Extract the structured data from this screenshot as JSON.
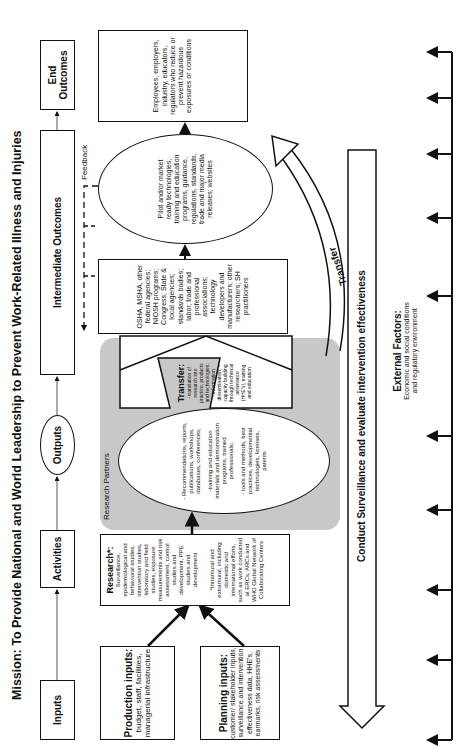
{
  "title": "Mission: To Provide National and World Leadership to Prevent Work-Related Illness and Injuries",
  "header_row": {
    "inputs": "Inputs",
    "activities": "Activities",
    "outputs": "Outputs",
    "intermediate": "Intermediate Outcomes",
    "end": "End Outcomes"
  },
  "inputs": {
    "production": {
      "heading": "Production inputs:",
      "text": "budget, staff, facilities, managerial infrastructure"
    },
    "planning": {
      "heading": "Planning inputs:",
      "text": "customer/ stakeholder inputs, surveillance and intervention effectiveness data, HHE's, earmarks, risk assessments"
    }
  },
  "research": {
    "heading": "Research*:",
    "text": "Surveillance, epidemiological and behavioral studies, intervention studies, laboratory and field studies, exposure measurements and risk assessment, control studies and development, PPE studies and development",
    "footnote": "*Intramural and extramural, including domestic and international efforts, such as work conducted at ERCs, ARCs and WHO Global Network of Collaborating Centers"
  },
  "research_partners": {
    "label": "Research Partners",
    "outputs_items": [
      "- Recommendations, reports, publications, workshops, databases, conferences;",
      "-training and education materials and demonstration programs, trained professionals;",
      "- tools and methods, best practices, developmental technologies, licenses, patents"
    ],
    "transfer_heading": "Transfer:",
    "transfer_text": "- translation of research into practice, products and technologies; - information dissemination; - capacity building through technical assistance (HHE's), training and education"
  },
  "intermediate": {
    "stakeholders": "OSHA, MSHA, other federal agencies; NIOSH programs; Congress; State & local agencies; standards bodies; labor, trade and professional associations; technology developers and manufacturers; other researchers; SH practitioners",
    "pilot": "Pilot and/or market ready technologies, training and education programs, guidance, regulations, standards, trade and major media releases; websites",
    "employees": "Employees, employers, industry, educators, regulators who reduce or prevent hazardous exposures or conditions"
  },
  "end_outcome": "Improvements in safety and health in workplaces",
  "feedback_label": "Feedback",
  "transfer_arrow_label": "Transfer",
  "surveillance_label": "Conduct Surveillance and evaluate intervention effectiveness",
  "external": {
    "heading": "External Factors:",
    "text": "Economic and social conditions and regulatory environment"
  }
}
